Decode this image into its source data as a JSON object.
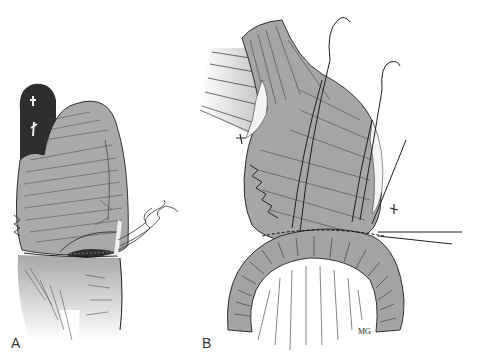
{
  "figure": {
    "panels": [
      {
        "id": "A",
        "label": "A",
        "description": "Stomach/pouch with sutured anastomosis and free suture ends to the right"
      },
      {
        "id": "B",
        "label": "B",
        "description": "Bowel loop anastomosis with curved needles and sutures"
      }
    ],
    "signature": "MG",
    "colors": {
      "background": "#ffffff",
      "tissue": "#a8a8a8",
      "tissue_light": "#c8c8c8",
      "dark_lumen": "#3a3a3a",
      "ink": "#1e1e1e"
    }
  }
}
